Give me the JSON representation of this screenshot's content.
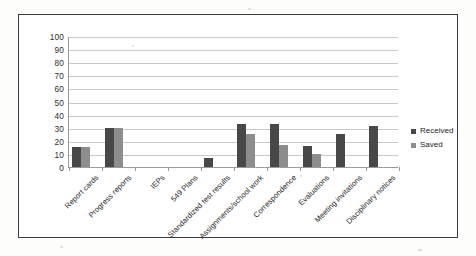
{
  "chart_data": {
    "type": "bar",
    "title": "",
    "xlabel": "",
    "ylabel": "",
    "ylim": [
      0,
      100
    ],
    "ytick_step": 10,
    "yticks": [
      "100",
      "90",
      "80",
      "70",
      "60",
      "50",
      "40",
      "30",
      "20",
      "10",
      "0"
    ],
    "grid": true,
    "legend_position": "right",
    "categories": [
      "Report cards",
      "Progress reports",
      "IEPs",
      "549 Plans",
      "Standardized test results",
      "Assignments/school work",
      "Correspondence",
      "Evaluations",
      "Meeting invitations",
      "Disciplinary notices"
    ],
    "series": [
      {
        "name": "Received",
        "color": "#484848",
        "values": [
          15,
          30,
          0,
          0,
          7,
          33,
          33,
          16,
          25,
          31
        ]
      },
      {
        "name": "Saved",
        "color": "#8d8d8d",
        "values": [
          15,
          30,
          0,
          0,
          0,
          25,
          17,
          10,
          0,
          0
        ]
      }
    ]
  },
  "legend": {
    "entries": [
      {
        "label": "Received",
        "color": "#484848"
      },
      {
        "label": "Saved",
        "color": "#8d8d8d"
      }
    ]
  },
  "colors": {
    "received": "#484848",
    "saved": "#8d8d8d",
    "gridline": "#c9c9c9",
    "axis": "#9a9a9a",
    "frame": "#3b3b3b",
    "background": "#ffffff"
  }
}
